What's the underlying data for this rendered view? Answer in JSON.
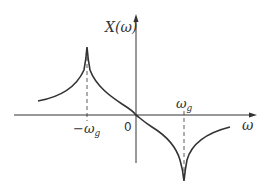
{
  "diagram": {
    "type": "frequency-response-plot",
    "y_axis_label": "X(ω)",
    "x_axis_label": "ω",
    "origin_label": "0",
    "neg_marker_label": "−ω",
    "neg_marker_sub": "g",
    "pos_marker_label": "ω",
    "pos_marker_sub": "g",
    "colors": {
      "line": "#333333",
      "background": "#ffffff"
    },
    "curve_description": "Odd function: rises to a sharp peak at −ωg, passes through origin with negative slope, drops to a sharp dip at +ωg, then recovers toward zero"
  }
}
